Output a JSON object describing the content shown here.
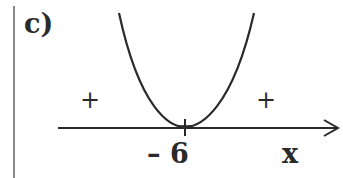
{
  "diagram": {
    "part_label": "c)",
    "left_sign": "+",
    "right_sign": "+",
    "root_label": "– 6",
    "axis_label": "x",
    "curve": "upward parabola tangent to x-axis at x = -6",
    "colors": {
      "stroke": "#2a2a2a",
      "divider": "#8a8a8a"
    }
  }
}
